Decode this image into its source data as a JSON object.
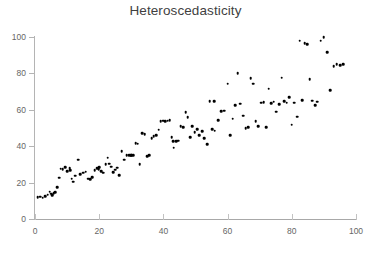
{
  "chart_data": {
    "type": "scatter",
    "title": "Heteroscedasticity",
    "xlabel": "",
    "ylabel": "",
    "xlim": [
      0,
      100
    ],
    "ylim": [
      0,
      100
    ],
    "grid": false,
    "legend": null,
    "marker": {
      "shape": "dot",
      "color": "#000000",
      "size": 2.6
    },
    "axis_color": "#b4b4b4",
    "tick_label_color": "#666666",
    "title_color": "#3f3f3f",
    "xticks": [
      0,
      20,
      40,
      60,
      80,
      100
    ],
    "yticks": [
      0,
      20,
      40,
      60,
      80,
      100
    ],
    "xtick_labels": [
      "0",
      "20",
      "40",
      "60",
      "80",
      "100"
    ],
    "ytick_labels": [
      "0",
      "20",
      "40",
      "60",
      "80",
      "100"
    ],
    "points": [
      [
        0.8,
        12.0
      ],
      [
        1.6,
        12.2
      ],
      [
        2.4,
        11.8
      ],
      [
        3.1,
        12.6
      ],
      [
        3.9,
        13.4
      ],
      [
        4.6,
        15.0
      ],
      [
        5.0,
        13.8
      ],
      [
        5.4,
        13.2
      ],
      [
        5.8,
        14.2
      ],
      [
        6.3,
        14.6
      ],
      [
        6.9,
        17.6
      ],
      [
        7.6,
        22.8
      ],
      [
        8.6,
        27.4
      ],
      [
        9.4,
        28.4
      ],
      [
        10.1,
        26.4
      ],
      [
        10.8,
        28.0
      ],
      [
        11.4,
        22.2
      ],
      [
        11.9,
        20.6
      ],
      [
        12.6,
        23.8
      ],
      [
        13.4,
        32.6
      ],
      [
        14.1,
        24.6
      ],
      [
        15.0,
        25.4
      ],
      [
        15.8,
        26.0
      ],
      [
        16.6,
        22.2
      ],
      [
        17.2,
        22.0
      ],
      [
        17.9,
        23.0
      ],
      [
        18.6,
        26.8
      ],
      [
        19.3,
        27.8
      ],
      [
        20.0,
        28.6
      ],
      [
        20.6,
        26.2
      ],
      [
        21.3,
        25.4
      ],
      [
        22.0,
        30.2
      ],
      [
        22.6,
        33.6
      ],
      [
        23.1,
        30.4
      ],
      [
        23.7,
        28.8
      ],
      [
        24.4,
        25.8
      ],
      [
        25.0,
        27.0
      ],
      [
        25.6,
        28.2
      ],
      [
        26.2,
        24.2
      ],
      [
        27.0,
        37.4
      ],
      [
        27.8,
        32.6
      ],
      [
        28.6,
        35.2
      ],
      [
        29.3,
        35.2
      ],
      [
        29.9,
        35.0
      ],
      [
        30.6,
        35.2
      ],
      [
        31.4,
        41.6
      ],
      [
        32.0,
        41.4
      ],
      [
        32.6,
        30.0
      ],
      [
        33.4,
        47.0
      ],
      [
        34.2,
        46.6
      ],
      [
        34.9,
        34.4
      ],
      [
        35.6,
        35.0
      ],
      [
        36.3,
        44.4
      ],
      [
        37.0,
        45.6
      ],
      [
        37.8,
        46.0
      ],
      [
        38.5,
        49.0
      ],
      [
        39.2,
        53.8
      ],
      [
        39.9,
        54.0
      ],
      [
        40.6,
        53.6
      ],
      [
        41.3,
        54.0
      ],
      [
        42.0,
        54.4
      ],
      [
        42.6,
        44.8
      ],
      [
        43.2,
        39.2
      ],
      [
        43.9,
        42.8
      ],
      [
        44.6,
        43.0
      ],
      [
        45.4,
        51.0
      ],
      [
        46.2,
        50.4
      ],
      [
        46.9,
        58.6
      ],
      [
        47.6,
        55.8
      ],
      [
        48.3,
        44.8
      ],
      [
        49.0,
        51.0
      ],
      [
        49.8,
        47.8
      ],
      [
        50.5,
        49.2
      ],
      [
        51.2,
        46.2
      ],
      [
        52.0,
        48.4
      ],
      [
        52.8,
        44.4
      ],
      [
        53.6,
        41.0
      ],
      [
        54.4,
        64.8
      ],
      [
        55.2,
        49.4
      ],
      [
        56.0,
        48.6
      ],
      [
        57.0,
        54.2
      ],
      [
        58.0,
        59.2
      ],
      [
        59.0,
        59.4
      ],
      [
        60.0,
        74.4
      ],
      [
        60.8,
        46.0
      ],
      [
        61.6,
        55.0
      ],
      [
        62.4,
        62.4
      ],
      [
        63.2,
        80.0
      ],
      [
        64.0,
        63.4
      ],
      [
        64.8,
        56.8
      ],
      [
        65.6,
        50.0
      ],
      [
        66.4,
        50.6
      ],
      [
        67.2,
        77.2
      ],
      [
        68.0,
        74.4
      ],
      [
        68.8,
        53.6
      ],
      [
        69.6,
        51.0
      ],
      [
        70.4,
        63.8
      ],
      [
        71.2,
        64.2
      ],
      [
        72.0,
        50.6
      ],
      [
        72.8,
        71.6
      ],
      [
        73.6,
        63.6
      ],
      [
        74.4,
        64.4
      ],
      [
        75.2,
        59.0
      ],
      [
        76.0,
        63.0
      ],
      [
        76.8,
        77.6
      ],
      [
        77.6,
        64.6
      ],
      [
        78.4,
        64.0
      ],
      [
        79.2,
        66.8
      ],
      [
        80.0,
        51.8
      ],
      [
        80.8,
        64.0
      ],
      [
        81.6,
        56.2
      ],
      [
        82.4,
        98.0
      ],
      [
        83.2,
        65.4
      ],
      [
        84.0,
        96.6
      ],
      [
        84.8,
        96.0
      ],
      [
        85.6,
        76.8
      ],
      [
        86.4,
        65.0
      ],
      [
        87.2,
        62.6
      ],
      [
        88.0,
        64.4
      ],
      [
        89.0,
        98.0
      ],
      [
        90.0,
        100.0
      ],
      [
        91.0,
        91.6
      ],
      [
        92.0,
        70.8
      ],
      [
        93.0,
        84.0
      ],
      [
        94.0,
        85.0
      ],
      [
        95.0,
        84.6
      ],
      [
        96.0,
        85.0
      ],
      [
        55.8,
        64.8
      ],
      [
        19.8,
        27.4
      ],
      [
        11.0,
        26.8
      ],
      [
        8.0,
        27.6
      ],
      [
        43.0,
        42.6
      ],
      [
        30.0,
        35.2
      ]
    ]
  }
}
